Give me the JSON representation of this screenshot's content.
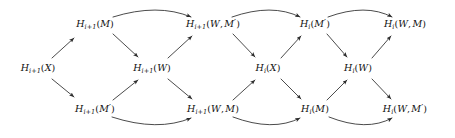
{
  "figure": {
    "kind": "commutative-braid-diagram",
    "width": 455,
    "height": 138,
    "background": "#ffffff",
    "ink_color": "#2b2b2b",
    "text_color": "#111111"
  },
  "nodes": [
    {
      "id": "n-top-1",
      "row": "top",
      "col": 1,
      "x": 95,
      "y": 24,
      "text": "H i+1 ( M )",
      "functor": "H",
      "subscript": "i+1",
      "args": [
        "M"
      ],
      "primes": [
        false
      ]
    },
    {
      "id": "n-top-2",
      "row": "top",
      "col": 2,
      "x": 213,
      "y": 24,
      "text": "H i+1 ( W , M' )",
      "functor": "H",
      "subscript": "i+1",
      "args": [
        "W",
        "M"
      ],
      "primes": [
        false,
        true
      ]
    },
    {
      "id": "n-top-3",
      "row": "top",
      "col": 3,
      "x": 315,
      "y": 24,
      "text": "H i ( M' )",
      "functor": "H",
      "subscript": "i",
      "args": [
        "M"
      ],
      "primes": [
        true
      ]
    },
    {
      "id": "n-top-4",
      "row": "top",
      "col": 4,
      "x": 405,
      "y": 24,
      "text": "H i ( W , M )",
      "functor": "H",
      "subscript": "i",
      "args": [
        "W",
        "M"
      ],
      "primes": [
        false,
        false
      ]
    },
    {
      "id": "n-mid-1",
      "row": "middle",
      "col": 1,
      "x": 38,
      "y": 68,
      "text": "H i+1 ( X )",
      "functor": "H",
      "subscript": "i+1",
      "args": [
        "X"
      ],
      "primes": [
        false
      ]
    },
    {
      "id": "n-mid-2",
      "row": "middle",
      "col": 2,
      "x": 152,
      "y": 68,
      "text": "H i+1 ( W )",
      "functor": "H",
      "subscript": "i+1",
      "args": [
        "W"
      ],
      "primes": [
        false
      ]
    },
    {
      "id": "n-mid-3",
      "row": "middle",
      "col": 3,
      "x": 268,
      "y": 68,
      "text": "H i ( X )",
      "functor": "H",
      "subscript": "i",
      "args": [
        "X"
      ],
      "primes": [
        false
      ]
    },
    {
      "id": "n-mid-4",
      "row": "middle",
      "col": 4,
      "x": 358,
      "y": 68,
      "text": "H i ( W )",
      "functor": "H",
      "subscript": "i",
      "args": [
        "W"
      ],
      "primes": [
        false
      ]
    },
    {
      "id": "n-bot-1",
      "row": "bottom",
      "col": 1,
      "x": 95,
      "y": 109,
      "text": "H i+1 ( M' )",
      "functor": "H",
      "subscript": "i+1",
      "args": [
        "M"
      ],
      "primes": [
        true
      ]
    },
    {
      "id": "n-bot-2",
      "row": "bottom",
      "col": 2,
      "x": 213,
      "y": 109,
      "text": "H i+1 ( W , M )",
      "functor": "H",
      "subscript": "i+1",
      "args": [
        "W",
        "M"
      ],
      "primes": [
        false,
        false
      ]
    },
    {
      "id": "n-bot-3",
      "row": "bottom",
      "col": 3,
      "x": 315,
      "y": 109,
      "text": "H i ( M )",
      "functor": "H",
      "subscript": "i",
      "args": [
        "M"
      ],
      "primes": [
        false
      ]
    },
    {
      "id": "n-bot-4",
      "row": "bottom",
      "col": 4,
      "x": 405,
      "y": 109,
      "text": "H i ( W , M' )",
      "functor": "H",
      "subscript": "i",
      "args": [
        "W",
        "M"
      ],
      "primes": [
        false,
        true
      ]
    }
  ],
  "edges": [
    {
      "id": "e1",
      "from": "n-mid-1",
      "to": "n-top-1",
      "style": "straight",
      "direction": "up-right"
    },
    {
      "id": "e2",
      "from": "n-mid-1",
      "to": "n-bot-1",
      "style": "straight",
      "direction": "down-right"
    },
    {
      "id": "e3",
      "from": "n-top-1",
      "to": "n-mid-2",
      "style": "straight",
      "direction": "down-right"
    },
    {
      "id": "e4",
      "from": "n-bot-1",
      "to": "n-mid-2",
      "style": "straight",
      "direction": "up-right"
    },
    {
      "id": "e5",
      "from": "n-mid-2",
      "to": "n-top-2",
      "style": "straight",
      "direction": "up-right"
    },
    {
      "id": "e6",
      "from": "n-mid-2",
      "to": "n-bot-2",
      "style": "straight",
      "direction": "down-right"
    },
    {
      "id": "e7",
      "from": "n-top-2",
      "to": "n-mid-3",
      "style": "straight",
      "direction": "down-right"
    },
    {
      "id": "e8",
      "from": "n-bot-2",
      "to": "n-mid-3",
      "style": "straight",
      "direction": "up-right"
    },
    {
      "id": "e9",
      "from": "n-mid-3",
      "to": "n-top-3",
      "style": "straight",
      "direction": "up-right"
    },
    {
      "id": "e10",
      "from": "n-mid-3",
      "to": "n-bot-3",
      "style": "straight",
      "direction": "down-right"
    },
    {
      "id": "e11",
      "from": "n-top-3",
      "to": "n-mid-4",
      "style": "straight",
      "direction": "down-right"
    },
    {
      "id": "e12",
      "from": "n-bot-3",
      "to": "n-mid-4",
      "style": "straight",
      "direction": "up-right"
    },
    {
      "id": "e13",
      "from": "n-mid-4",
      "to": "n-top-4",
      "style": "straight",
      "direction": "up-right"
    },
    {
      "id": "e14",
      "from": "n-mid-4",
      "to": "n-bot-4",
      "style": "straight",
      "direction": "down-right"
    },
    {
      "id": "a1",
      "from": "n-top-1",
      "to": "n-top-2",
      "style": "arc-over",
      "direction": "right"
    },
    {
      "id": "a2",
      "from": "n-top-2",
      "to": "n-top-3",
      "style": "arc-over",
      "direction": "right"
    },
    {
      "id": "a3",
      "from": "n-top-3",
      "to": "n-top-4",
      "style": "arc-over",
      "direction": "right"
    },
    {
      "id": "a4",
      "from": "n-bot-1",
      "to": "n-bot-2",
      "style": "arc-under",
      "direction": "right"
    },
    {
      "id": "a5",
      "from": "n-bot-2",
      "to": "n-bot-3",
      "style": "arc-under",
      "direction": "right"
    },
    {
      "id": "a6",
      "from": "n-bot-3",
      "to": "n-bot-4",
      "style": "arc-under",
      "direction": "right"
    }
  ]
}
